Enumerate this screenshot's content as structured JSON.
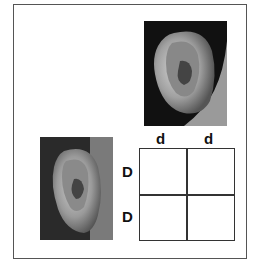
{
  "diagram": {
    "type": "punnett-square",
    "images": [
      {
        "name": "free-earlobe-photo",
        "description": "ear with free earlobe"
      },
      {
        "name": "attached-earlobe-photo",
        "description": "ear with attached earlobe"
      }
    ],
    "punnett": {
      "column_alleles": [
        "d",
        "d"
      ],
      "row_alleles": [
        "D",
        "D"
      ],
      "cells": [
        [
          "",
          ""
        ],
        [
          "",
          ""
        ]
      ]
    }
  }
}
